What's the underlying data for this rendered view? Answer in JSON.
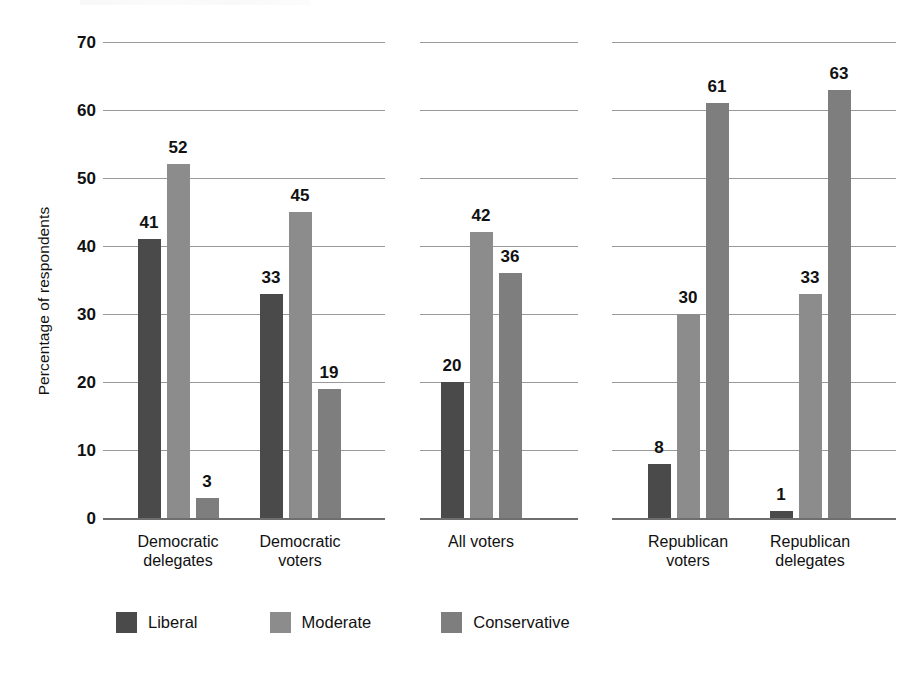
{
  "chart_data": {
    "type": "bar",
    "title": "",
    "xlabel": "",
    "ylabel": "Percentage of respondents",
    "ylim": [
      0,
      70
    ],
    "yticks": [
      0,
      10,
      20,
      30,
      40,
      50,
      60,
      70
    ],
    "ytick_labels": [
      "0",
      "10",
      "20",
      "30",
      "40",
      "50",
      "60",
      "70"
    ],
    "grid": true,
    "legend_position": "bottom-left",
    "categories": [
      "Democratic delegates",
      "Democratic voters",
      "All voters",
      "Republican voters",
      "Republican delegates"
    ],
    "category_lines": [
      [
        "Democratic",
        "delegates"
      ],
      [
        "Democratic",
        "voters"
      ],
      [
        "All voters"
      ],
      [
        "Republican",
        "voters"
      ],
      [
        "Republican",
        "delegates"
      ]
    ],
    "panels": [
      {
        "name": "Democrats",
        "categories": [
          "Democratic delegates",
          "Democratic voters"
        ]
      },
      {
        "name": "All voters",
        "categories": [
          "All voters"
        ]
      },
      {
        "name": "Republicans",
        "categories": [
          "Republican voters",
          "Republican delegates"
        ]
      }
    ],
    "series": [
      {
        "name": "Liberal",
        "color": "#4a4a4a",
        "values": [
          41,
          33,
          20,
          8,
          1
        ]
      },
      {
        "name": "Moderate",
        "color": "#8c8c8c",
        "values": [
          52,
          45,
          42,
          30,
          33
        ]
      },
      {
        "name": "Conservative",
        "color": "#7e7e7e",
        "values": [
          3,
          19,
          36,
          61,
          63
        ]
      }
    ],
    "bar_labels": [
      [
        "41",
        "52",
        "3"
      ],
      [
        "33",
        "45",
        "19"
      ],
      [
        "20",
        "42",
        "36"
      ],
      [
        "8",
        "30",
        "61"
      ],
      [
        "1",
        "33",
        "63"
      ]
    ]
  },
  "legend": {
    "items": [
      {
        "label": "Liberal",
        "color": "#4a4a4a"
      },
      {
        "label": "Moderate",
        "color": "#8c8c8c"
      },
      {
        "label": "Conservative",
        "color": "#7e7e7e"
      }
    ]
  },
  "axis": {
    "y_title": "Percentage of respondents"
  }
}
